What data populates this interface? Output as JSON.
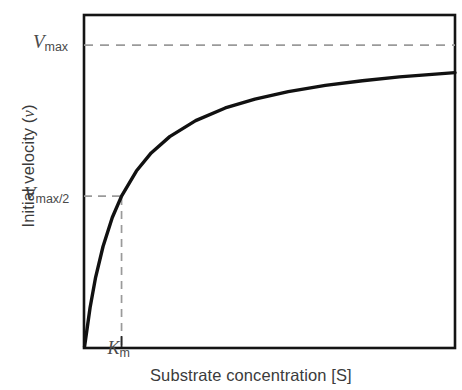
{
  "chart_data": {
    "type": "line",
    "title": "",
    "subtitle": "",
    "xlabel": "Substrate concentration [S]",
    "ylabel": "Initial velocity (v)",
    "ylabel_parts": {
      "text": "Initial velocity (",
      "italic": "v",
      "tail": ")"
    },
    "curve_name": "Michaelis-Menten saturation curve",
    "equation": "v = Vmax[S] / (Km + [S])",
    "grid": false,
    "legend": false,
    "xlim": [
      0,
      10
    ],
    "ylim": [
      0,
      1.1
    ],
    "axis_ticks_numeric": false,
    "parameters": {
      "Vmax": 1.0,
      "Km": 1.0,
      "Vmax_half": 0.5
    },
    "x": [
      0,
      0.15,
      0.3,
      0.5,
      0.75,
      1,
      1.4,
      1.8,
      2.3,
      3,
      3.8,
      4.6,
      5.5,
      6.5,
      7.5,
      8.5,
      10
    ],
    "values": [
      0,
      0.13,
      0.231,
      0.333,
      0.429,
      0.5,
      0.583,
      0.643,
      0.697,
      0.75,
      0.792,
      0.821,
      0.846,
      0.867,
      0.882,
      0.895,
      0.909
    ],
    "annotations": [
      {
        "name": "vmax-line",
        "type": "hline",
        "y": 1.0,
        "style": "dashed",
        "label": "Vmax"
      },
      {
        "name": "vmax-half-line",
        "type": "hline",
        "y": 0.5,
        "style": "dashed",
        "label": "Vmax/2",
        "x_end": 1.0
      },
      {
        "name": "km-line",
        "type": "vline",
        "x": 1.0,
        "style": "dashed",
        "label": "Km",
        "y_end": 0.5
      }
    ],
    "tick_labels": {
      "vmax": {
        "symbol": "V",
        "subscript": "max"
      },
      "vmax_half": {
        "symbol": "V",
        "subscript": "max/2"
      },
      "km": {
        "symbol": "K",
        "subscript": "m"
      }
    },
    "colors": {
      "curve": "#111111",
      "frame": "#141414",
      "dashed": "#9a9a9a",
      "text": "#3b3b3b",
      "background": "#ffffff"
    }
  },
  "labels": {
    "vmax_symbol": "V",
    "vmax_sub": "max",
    "vmaxhalf_symbol": "V",
    "vmaxhalf_sub": "max/2",
    "km_symbol": "K",
    "km_sub": "m",
    "yaxis_text": "Initial velocity (",
    "yaxis_italic": "v",
    "yaxis_tail": ")",
    "xaxis_title": "Substrate concentration [S]"
  }
}
